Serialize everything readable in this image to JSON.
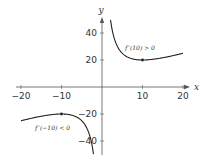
{
  "chart_data": {
    "type": "line",
    "title": "",
    "xlabel": "x",
    "ylabel": "y",
    "xlim": [
      -21,
      21
    ],
    "ylim": [
      -50,
      50
    ],
    "grid": false,
    "x_ticks": [
      -20,
      -10,
      10,
      20
    ],
    "y_ticks": [
      40,
      20,
      -20,
      -40
    ],
    "x_tick_labels": [
      "−20",
      "−10",
      "10",
      "20"
    ],
    "y_tick_labels": [
      "40",
      "20",
      "−20",
      "−40"
    ],
    "series": [
      {
        "name": "f(x) = x + 100/x (x > 0)",
        "x": [
          2.1,
          3,
          4,
          5,
          6,
          8,
          10,
          12,
          15,
          18,
          20
        ],
        "y": [
          49.7,
          36.3,
          29,
          25,
          22.7,
          20.5,
          20,
          20.3,
          21.7,
          23.6,
          25
        ]
      },
      {
        "name": "f(x) = x + 100/x (x < 0)",
        "x": [
          -20,
          -18,
          -15,
          -12,
          -10,
          -8,
          -6,
          -5,
          -4,
          -3,
          -2.1
        ],
        "y": [
          -25,
          -23.6,
          -21.7,
          -20.3,
          -20,
          -20.5,
          -22.7,
          -25,
          -29,
          -36.3,
          -49.7
        ]
      }
    ],
    "points": [
      {
        "x": 10,
        "y": 20
      },
      {
        "x": -10,
        "y": -20
      }
    ],
    "annotations": [
      {
        "text": "f′′(10) > 0",
        "x": 10,
        "y": 30
      },
      {
        "text": "f′′(−10) < 0",
        "x": -13,
        "y": -30
      }
    ],
    "colors": {
      "axis": "#555555",
      "curve": "#222222",
      "text": "#333333"
    }
  }
}
